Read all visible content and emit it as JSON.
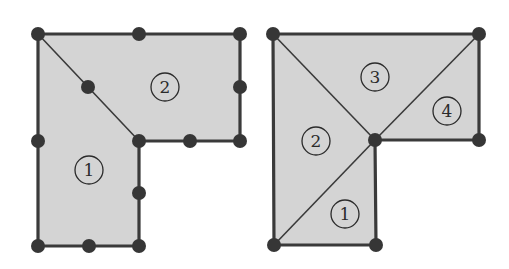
{
  "colors": {
    "background": "#ffffff",
    "fill": "#d4d4d4",
    "stroke": "#3a3a3a",
    "node": "#363636",
    "label": "#2a2a2a"
  },
  "figures": [
    {
      "id": "left",
      "description": "L-shaped domain split into 2 elements with mid-side nodes",
      "outline": [
        [
          38,
          34
        ],
        [
          240,
          34
        ],
        [
          240,
          141
        ],
        [
          139,
          141
        ],
        [
          139,
          246
        ],
        [
          38,
          246
        ]
      ],
      "internal_edges": [
        [
          [
            38,
            34
          ],
          [
            139,
            141
          ]
        ]
      ],
      "nodes": [
        [
          38,
          34
        ],
        [
          139,
          34
        ],
        [
          240,
          34
        ],
        [
          88,
          87
        ],
        [
          240,
          87
        ],
        [
          38,
          141
        ],
        [
          139,
          141
        ],
        [
          190,
          141
        ],
        [
          240,
          141
        ],
        [
          139,
          193
        ],
        [
          38,
          246
        ],
        [
          89,
          246
        ],
        [
          139,
          246
        ]
      ],
      "elements": [
        {
          "label": "1",
          "x": 89,
          "y": 170
        },
        {
          "label": "2",
          "x": 165,
          "y": 87
        }
      ]
    },
    {
      "id": "right",
      "description": "L-shaped domain split into 4 triangular elements",
      "outline": [
        [
          273,
          34
        ],
        [
          479,
          34
        ],
        [
          479,
          140
        ],
        [
          375,
          140
        ],
        [
          376,
          245
        ],
        [
          274,
          245
        ]
      ],
      "internal_edges": [
        [
          [
            273,
            34
          ],
          [
            375,
            140
          ]
        ],
        [
          [
            479,
            34
          ],
          [
            375,
            140
          ]
        ],
        [
          [
            375,
            140
          ],
          [
            274,
            245
          ]
        ]
      ],
      "nodes": [
        [
          273,
          34
        ],
        [
          479,
          34
        ],
        [
          375,
          140
        ],
        [
          479,
          140
        ],
        [
          274,
          245
        ],
        [
          376,
          245
        ]
      ],
      "elements": [
        {
          "label": "1",
          "x": 345,
          "y": 214
        },
        {
          "label": "2",
          "x": 316,
          "y": 141
        },
        {
          "label": "3",
          "x": 375,
          "y": 77
        },
        {
          "label": "4",
          "x": 447,
          "y": 111
        }
      ]
    }
  ]
}
